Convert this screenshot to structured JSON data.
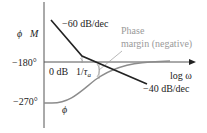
{
  "diagram": {
    "type": "bode-plot-sketch",
    "axes": {
      "y_axis_label_phase": "ϕ",
      "y_axis_label_magnitude": "M",
      "x_axis_label": "log ω",
      "ticks": {
        "minus180": "−180°",
        "minus270": "−270°"
      }
    },
    "labels": {
      "zero_db": "0 dB",
      "corner_freq_num": "1/",
      "corner_freq_tau": "τ",
      "corner_freq_sub": "a",
      "slope_high": "−60 dB/dec",
      "slope_low": "−40 dB/dec",
      "phase_margin_line1": "Phase",
      "phase_margin_line2": "margin (negative)",
      "phase_curve_label": "ϕ"
    },
    "curves": {
      "magnitude": {
        "color": "#222222",
        "points": [
          [
            51,
            20
          ],
          [
            82,
            56
          ],
          [
            147,
            84
          ]
        ]
      },
      "phase": {
        "color": "#8c8c8c",
        "start_level": "−270°",
        "end_level": "−180°"
      }
    },
    "colors": {
      "axis": "#555555",
      "magnitude": "#222222",
      "phase": "#8c8c8c",
      "annotation": "#9a9a9a"
    }
  }
}
